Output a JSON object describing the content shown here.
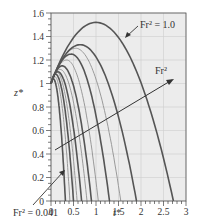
{
  "chart_data": {
    "type": "line",
    "title": "",
    "xlabel": "t*",
    "ylabel": "z*",
    "xlim": [
      0,
      3
    ],
    "ylim": [
      0,
      1.6
    ],
    "grid": true,
    "x_ticks": [
      "0",
      "0.5",
      "1",
      "1.5",
      "2",
      "2.5",
      "3"
    ],
    "y_ticks": [
      "0",
      "0.2",
      "0.4",
      "0.6",
      "0.8",
      "1",
      "1.2",
      "1.4",
      "1.6"
    ],
    "series": [
      {
        "name": "Fr² = 0.041",
        "peak_z": 1.04,
        "peak_t": 0.05,
        "end_t": 0.32
      },
      {
        "name": "Fr² ≈ 0.06",
        "peak_z": 1.06,
        "peak_t": 0.08,
        "end_t": 0.42
      },
      {
        "name": "Fr² ≈ 0.08",
        "peak_z": 1.08,
        "peak_t": 0.1,
        "end_t": 0.5
      },
      {
        "name": "Fr² ≈ 0.1",
        "peak_z": 1.1,
        "peak_t": 0.12,
        "end_t": 0.58
      },
      {
        "name": "Fr² ≈ 0.15",
        "peak_z": 1.1,
        "peak_t": 0.15,
        "end_t": 0.68
      },
      {
        "name": "Fr² ≈ 0.2",
        "peak_z": 1.12,
        "peak_t": 0.2,
        "end_t": 0.8
      },
      {
        "name": "Fr² ≈ 0.3",
        "peak_z": 1.15,
        "peak_t": 0.25,
        "end_t": 0.9
      },
      {
        "name": "Fr² ≈ 0.4",
        "peak_z": 1.2,
        "peak_t": 0.35,
        "end_t": 1.05
      },
      {
        "name": "Fr² ≈ 0.5",
        "peak_z": 1.25,
        "peak_t": 0.45,
        "end_t": 1.3
      },
      {
        "name": "Fr² ≈ 0.6",
        "peak_z": 1.3,
        "peak_t": 0.55,
        "end_t": 1.55
      },
      {
        "name": "Fr² ≈ 0.7",
        "peak_z": 1.33,
        "peak_t": 0.65,
        "end_t": 1.9
      },
      {
        "name": "Fr² = 1.0",
        "peak_z": 1.52,
        "peak_t": 1.0,
        "end_t": 2.72
      }
    ],
    "annotations": [
      {
        "text": "Fr² = 1.0",
        "points_to": "outermost curve"
      },
      {
        "text": "Fr²",
        "meaning": "increasing Fr² direction arrow"
      },
      {
        "text": "Fr² = 0.041",
        "points_to": "innermost curve"
      }
    ],
    "legend": "none"
  },
  "labels": {
    "xlabel": "t*",
    "ylabel": "z*",
    "annot_top": "Fr² = 1.0",
    "annot_mid": "Fr²",
    "annot_bottom": "Fr² = 0.041"
  }
}
